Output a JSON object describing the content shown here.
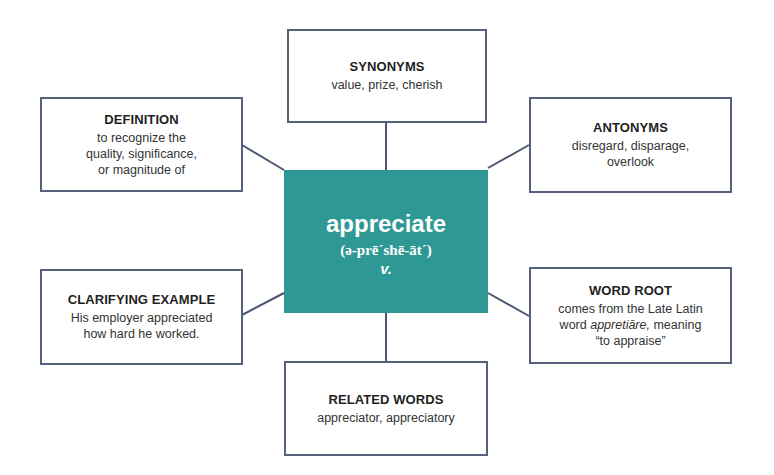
{
  "center": {
    "word": "appreciate",
    "pronunciation": "(ə-prē´shē-āt´)",
    "part_of_speech": "v.",
    "color": "#2e9994"
  },
  "boxes": {
    "synonyms": {
      "title": "SYNONYMS",
      "lines": [
        "value, prize, cherish"
      ]
    },
    "definition": {
      "title": "DEFINITION",
      "lines": [
        "to recognize the",
        "quality, significance,",
        "or magnitude of"
      ]
    },
    "antonyms": {
      "title": "ANTONYMS",
      "lines": [
        "disregard, disparage,",
        "overlook"
      ]
    },
    "clarifying_example": {
      "title": "CLARIFYING EXAMPLE",
      "lines": [
        "His employer appreciated",
        "how hard he worked."
      ]
    },
    "word_root": {
      "title": "WORD ROOT",
      "line1": "comes from the Late Latin",
      "line2_prefix": "word ",
      "line2_italic": "appretiāre,",
      "line2_suffix": " meaning",
      "line3": "“to appraise”"
    },
    "related_words": {
      "title": "RELATED WORDS",
      "lines": [
        "appreciator, appreciatory"
      ]
    }
  },
  "colors": {
    "border": "#55607a",
    "connector": "#4a5570",
    "center_fill": "#2e9994"
  }
}
